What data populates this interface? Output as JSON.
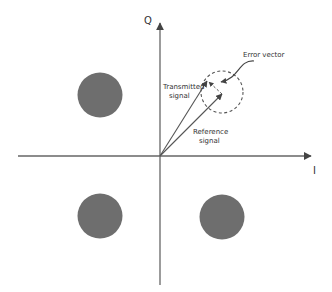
{
  "diagram": {
    "title": "",
    "axes": {
      "horizontal_label": "I",
      "vertical_label": "Q"
    },
    "constellation_points": [
      {
        "name": "top-left",
        "quadrant": "II"
      },
      {
        "name": "top-right",
        "quadrant": "I",
        "note": "shown as dashed region"
      },
      {
        "name": "bottom-left",
        "quadrant": "III"
      },
      {
        "name": "bottom-right",
        "quadrant": "IV"
      }
    ],
    "labels": {
      "transmitted_line1": "Transmitted",
      "transmitted_line2": "signal",
      "reference_line1": "Reference",
      "reference_line2": "signal",
      "error_vector": "Error vector"
    },
    "colors": {
      "point_fill": "#6e6e6e",
      "line": "#555555",
      "background": "#ffffff"
    }
  }
}
